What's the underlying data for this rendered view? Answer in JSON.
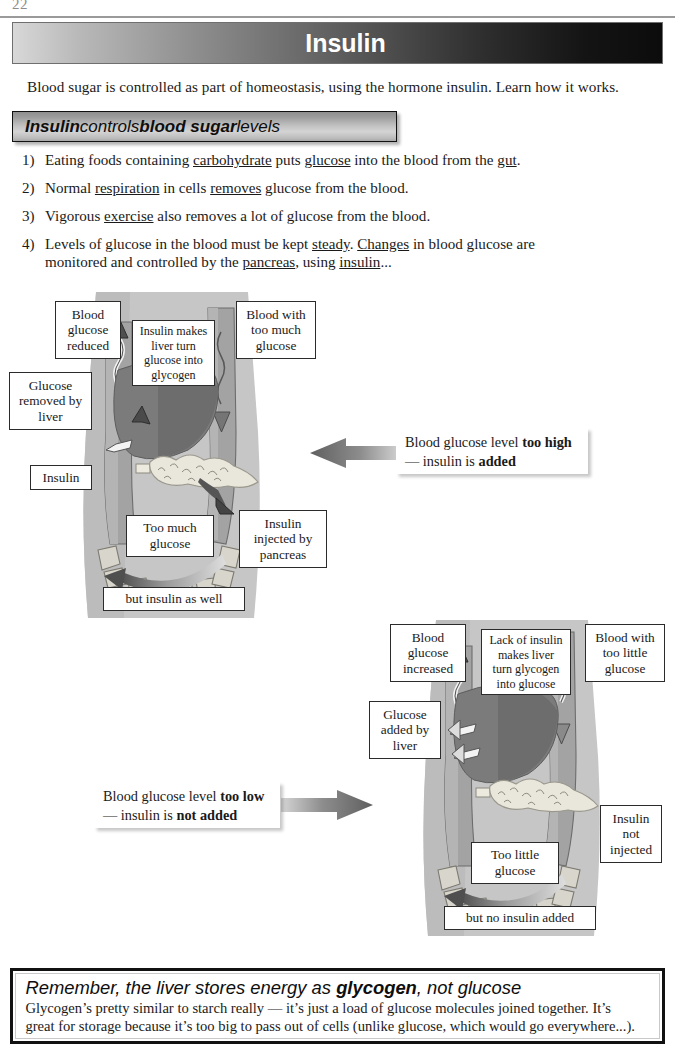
{
  "page": {
    "number": "22"
  },
  "title": {
    "text": "Insulin"
  },
  "intro": {
    "text": "Blood sugar is controlled as part of homeostasis, using the hormone insulin.  Learn how it works."
  },
  "subheading": {
    "part1": "Insulin",
    "part2": " controls ",
    "part3": "blood sugar",
    "part4": " levels"
  },
  "list": [
    {
      "num": "1)",
      "segments": [
        {
          "t": "Eating foods containing "
        },
        {
          "t": "carbohydrate",
          "u": true
        },
        {
          "t": " puts "
        },
        {
          "t": "glucose",
          "u": true
        },
        {
          "t": " into the blood from the "
        },
        {
          "t": "gut",
          "u": true
        },
        {
          "t": "."
        }
      ]
    },
    {
      "num": "2)",
      "segments": [
        {
          "t": "Normal "
        },
        {
          "t": "respiration",
          "u": true
        },
        {
          "t": " in cells "
        },
        {
          "t": "removes",
          "u": true
        },
        {
          "t": " glucose from the blood."
        }
      ]
    },
    {
      "num": "3)",
      "segments": [
        {
          "t": "Vigorous "
        },
        {
          "t": "exercise",
          "u": true
        },
        {
          "t": " also removes a lot of glucose from the blood."
        }
      ]
    },
    {
      "num": "4)",
      "segments": [
        {
          "t": "Levels of glucose in the blood must be kept "
        },
        {
          "t": "steady",
          "u": true
        },
        {
          "t": ".  "
        },
        {
          "t": "Changes",
          "u": true
        },
        {
          "t": " in blood glucose are"
        },
        {
          "t": "\n"
        },
        {
          "t": "monitored and controlled by the "
        },
        {
          "t": "pancreas",
          "u": true
        },
        {
          "t": ", using "
        },
        {
          "t": "insulin",
          "u": true
        },
        {
          "t": "..."
        }
      ]
    }
  ],
  "diagram_high": {
    "labels": {
      "blood_glucose_reduced": "Blood\nglucose\nreduced",
      "insulin_makes_liver": "Insulin makes\nliver turn\nglucose into\nglycogen",
      "blood_too_much": "Blood with\ntoo much\nglucose",
      "glucose_removed_by_liver": "Glucose\nremoved by\nliver",
      "insulin": "Insulin",
      "too_much_glucose": "Too much\nglucose",
      "insulin_injected": "Insulin\ninjected by\npancreas",
      "but_insulin_as_well": "but insulin as well"
    },
    "callout": {
      "line1_plain": "Blood glucose level ",
      "line1_bold": "too high",
      "line2_plain": "— insulin is ",
      "line2_bold": "added"
    },
    "arrow_direction": "left"
  },
  "diagram_low": {
    "labels": {
      "blood_glucose_increased": "Blood\nglucose\nincreased",
      "lack_of_insulin": "Lack of insulin\nmakes liver\nturn glycogen\ninto glucose",
      "blood_too_little": "Blood with\ntoo little\nglucose",
      "glucose_added_by_liver": "Glucose\nadded by\nliver",
      "insulin_not_injected": "Insulin\nnot\ninjected",
      "too_little_glucose": "Too little\nglucose",
      "but_no_insulin_added": "but no insulin added"
    },
    "callout": {
      "line1_plain": "Blood glucose level ",
      "line1_bold": "too low",
      "line2_plain": "— insulin is ",
      "line2_bold": "not added"
    },
    "arrow_direction": "right"
  },
  "remember": {
    "title_part1": "Remember, the liver stores energy as ",
    "title_bold": "glycogen",
    "title_part2": ", not glucose",
    "line1": "Glycogen’s pretty similar to starch really — it’s just a load of glucose molecules joined together.  It’s",
    "line2": "great for storage because it’s too big to pass out of cells (unlike glucose, which would go everywhere...)."
  },
  "colors": {
    "torso": "#c6c6c6",
    "torso_shade": "#b4b4b4",
    "liver": "#7b7b7b",
    "liver_dark": "#6a6a6a",
    "pancreas": "#e9e7dc",
    "vessel": "#9e9e9e",
    "vessel_light": "#b0b0b0",
    "arrow_grey": "#6e6e6e",
    "banner_dark": "#0c0c0c",
    "banner_light": "#d8d8d8"
  }
}
